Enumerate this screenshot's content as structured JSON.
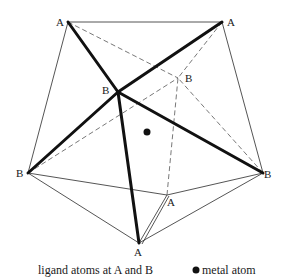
{
  "figure": {
    "vertices": {
      "A1": {
        "label": "A",
        "x": 68,
        "y": 22,
        "lx": 56,
        "ly": 26
      },
      "A2": {
        "label": "A",
        "x": 222,
        "y": 22,
        "lx": 227,
        "ly": 26
      },
      "B1": {
        "label": "B",
        "x": 28,
        "y": 173,
        "lx": 16,
        "ly": 177
      },
      "B2": {
        "label": "B",
        "x": 263,
        "y": 173,
        "lx": 264,
        "ly": 178
      },
      "A3": {
        "label": "A",
        "x": 139,
        "y": 243,
        "lx": 134,
        "ly": 256
      },
      "A4": {
        "label": "A",
        "x": 167,
        "y": 195,
        "lx": 167,
        "ly": 206
      },
      "B3": {
        "label": "B",
        "x": 118,
        "y": 92,
        "lx": 102,
        "ly": 94
      },
      "B4": {
        "label": "B",
        "x": 178,
        "y": 78,
        "lx": 185,
        "ly": 82
      }
    },
    "metal_atom": {
      "x": 147,
      "y": 132,
      "r": 3.5
    }
  },
  "legend": {
    "ligand_text": "ligand atoms at A and B",
    "metal_text": "metal atom"
  },
  "colors": {
    "line": "#1a1a1a",
    "dashed": "#555555",
    "background": "#ffffff"
  }
}
